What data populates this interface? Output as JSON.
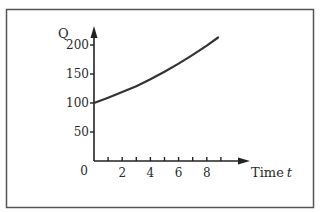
{
  "chart_data": {
    "type": "line",
    "title": "",
    "xlabel": "Time",
    "xlabel_var": "t",
    "ylabel": "Q",
    "xlim": [
      0,
      11
    ],
    "ylim": [
      0,
      230
    ],
    "x_ticks": [
      2,
      4,
      6,
      8
    ],
    "x_minor_ticks": [
      1,
      3,
      5,
      7,
      9
    ],
    "x_tick_labels": [
      "2",
      "4",
      "6",
      "8"
    ],
    "y_ticks": [
      50,
      100,
      150,
      200
    ],
    "y_tick_labels": [
      "50",
      "100",
      "150",
      "200"
    ],
    "origin_label": "0",
    "grid": false,
    "legend": "none",
    "series": [
      {
        "name": "Q",
        "description": "exponential growth from 100",
        "x": [
          0,
          1,
          2,
          3,
          4,
          5,
          6,
          7,
          8,
          8.8
        ],
        "values": [
          100,
          109,
          119,
          129,
          141,
          154,
          168,
          183,
          199,
          213
        ]
      }
    ],
    "colors": {
      "curve": "#333333",
      "axis": "#222222",
      "frame": "#555555"
    }
  }
}
